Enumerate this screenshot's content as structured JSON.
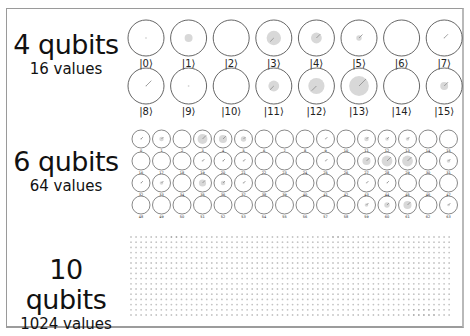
{
  "sections": [
    {
      "title": "4 qubits",
      "subtitle": "16 values",
      "layout": {
        "cols": 8,
        "rows": 2,
        "x0": 146,
        "y0": 38,
        "dx": 42.6,
        "dy": 48,
        "r": 18,
        "label_offset": 24,
        "label_size": 10
      },
      "states": [
        {
          "label": "|0⟩",
          "mag": 0.05,
          "phase": 0
        },
        {
          "label": "|1⟩",
          "mag": 0.22,
          "phase": 0
        },
        {
          "label": "|2⟩",
          "mag": 0.0,
          "phase": 0
        },
        {
          "label": "|3⟩",
          "mag": 0.4,
          "phase": -30
        },
        {
          "label": "|4⟩",
          "mag": 0.3,
          "phase": 45
        },
        {
          "label": "|5⟩",
          "mag": 0.15,
          "phase": 140
        },
        {
          "label": "|6⟩",
          "mag": 0.0,
          "phase": 0
        },
        {
          "label": "|7⟩",
          "mag": 0.02,
          "phase": 135
        },
        {
          "label": "|8⟩",
          "mag": 0.02,
          "phase": 100
        },
        {
          "label": "|9⟩",
          "mag": 0.05,
          "phase": 0
        },
        {
          "label": "|10⟩",
          "mag": 0.0,
          "phase": 0
        },
        {
          "label": "|11⟩",
          "mag": 0.3,
          "phase": 225
        },
        {
          "label": "|12⟩",
          "mag": 0.45,
          "phase": -35
        },
        {
          "label": "|13⟩",
          "mag": 0.55,
          "phase": 45
        },
        {
          "label": "|14⟩",
          "mag": 0.0,
          "phase": 0
        },
        {
          "label": "|15⟩",
          "mag": 0.22,
          "phase": 45
        }
      ]
    },
    {
      "title": "6 qubits",
      "subtitle": "64 values",
      "layout": {
        "cols": 16,
        "rows": 4,
        "x0": 141,
        "y0": 139,
        "dx": 20.5,
        "dy": 22,
        "r": 9,
        "label_offset": 11.5,
        "label_size": 3.5
      },
      "magnitudes": [
        0.1,
        0.25,
        0,
        0.55,
        0.45,
        0.3,
        0,
        0,
        0,
        0.05,
        0,
        0.25,
        0.2,
        0.2,
        0,
        0,
        0,
        0,
        0,
        0.1,
        0.1,
        0.1,
        0,
        0,
        0,
        0.05,
        0,
        0.45,
        0.6,
        0.6,
        0,
        0.2,
        0.05,
        0.2,
        0,
        0.4,
        0.25,
        0.1,
        0,
        0,
        0,
        0,
        0,
        0.05,
        0.05,
        0,
        0,
        0,
        0,
        0,
        0,
        0,
        0,
        0,
        0,
        0,
        0,
        0,
        0,
        0.2,
        0.3,
        0.45,
        0,
        0.15
      ]
    },
    {
      "title": "10 qubits",
      "subtitle": "1024 values",
      "layout": {
        "cols": 64,
        "rows": 16,
        "x0": 131,
        "y0": 237,
        "dx": 5.05,
        "dy": 5.2
      }
    }
  ],
  "colors": {
    "circle_stroke": "#555555",
    "fill": "#d8d8d8",
    "line": "#8a8a8a",
    "dot": "#c4c4c4",
    "text": "#111111"
  }
}
